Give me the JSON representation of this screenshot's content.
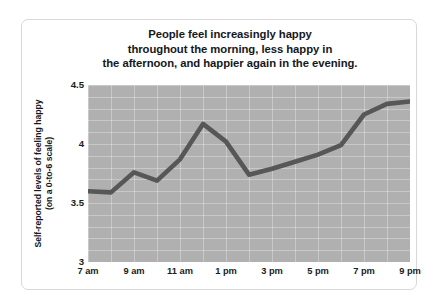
{
  "chart_data": {
    "type": "line",
    "title": "People feel increasingly happy throughout the morning, less happy in the afternoon, and happier again in the evening.",
    "title_lines": [
      "People feel increasingly happy",
      "throughout the morning, less happy in",
      "the afternoon, and happier again in the evening."
    ],
    "ylabel": "Self-reported levels of feeling happy (on a 0-to-6 scale)",
    "ylabel_lines": [
      "Self-reported levels of feeling happy",
      "(on a 0-to-6 scale)"
    ],
    "xlabel": "",
    "ylim": [
      3,
      4.5
    ],
    "yticks": [
      "3",
      "3.5",
      "4",
      "4.5"
    ],
    "ytick_values": [
      3,
      3.5,
      4,
      4.5
    ],
    "xticks": [
      "7 am",
      "9 am",
      "11 am",
      "1 pm",
      "3 pm",
      "5 pm",
      "7 pm",
      "9 pm"
    ],
    "x": [
      "7 am",
      "8 am",
      "9 am",
      "10 am",
      "11 am",
      "12 pm",
      "1 pm",
      "2 pm",
      "3 pm",
      "4 pm",
      "5 pm",
      "6 pm",
      "7 pm",
      "8 pm",
      "9 pm"
    ],
    "values": [
      3.6,
      3.59,
      3.76,
      3.69,
      3.87,
      4.17,
      4.02,
      3.74,
      3.79,
      3.85,
      3.91,
      3.99,
      4.25,
      4.34,
      4.36
    ],
    "series": [
      {
        "name": "Self-reported happiness",
        "values": [
          3.6,
          3.59,
          3.76,
          3.69,
          3.87,
          4.17,
          4.02,
          3.74,
          3.79,
          3.85,
          3.91,
          3.99,
          4.25,
          4.34,
          4.36
        ]
      }
    ],
    "grid": true,
    "legend": false,
    "legend_position": "none",
    "line_color": "#575757",
    "plot_background": "#b0b0b0",
    "grid_color": "#ffffff",
    "figure_background": "#ffffff",
    "text_color": "#15181c"
  }
}
